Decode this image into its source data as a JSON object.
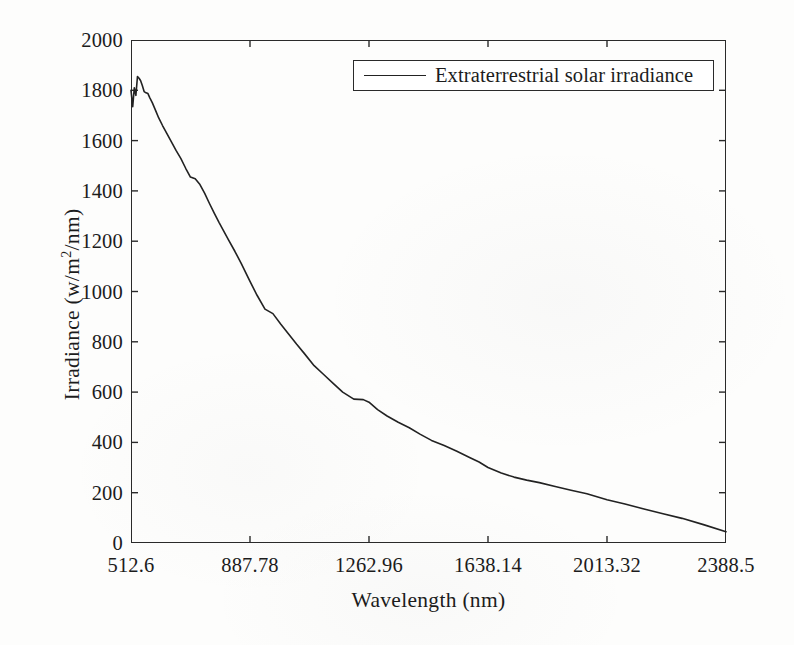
{
  "chart_data": {
    "type": "line",
    "title": "",
    "xlabel": "Wavelength (nm)",
    "ylabel": "Irradiance  (w/m2/nm)",
    "ylabel_base": "Irradiance  (w/m",
    "ylabel_sup": "2",
    "ylabel_tail": "/nm)",
    "xlim": [
      512.6,
      2388.5
    ],
    "ylim": [
      0,
      2000
    ],
    "grid": false,
    "legend_position": "top-right-inside",
    "xticks": [
      512.6,
      887.78,
      1262.96,
      1638.14,
      2013.32,
      2388.5
    ],
    "xtick_labels": [
      "512.6",
      "887.78",
      "1262.96",
      "1638.14",
      "2013.32",
      "2388.5"
    ],
    "yticks": [
      0,
      200,
      400,
      600,
      800,
      1000,
      1200,
      1400,
      1600,
      1800,
      2000
    ],
    "ytick_labels": [
      "0",
      "200",
      "400",
      "600",
      "800",
      "1000",
      "1200",
      "1400",
      "1600",
      "1800",
      "2000"
    ],
    "series": [
      {
        "name": "Extraterrestrial solar irradiance",
        "color": "#222222",
        "linewidth": 1.6,
        "x": [
          512.6,
          518,
          523,
          528,
          533,
          538,
          543,
          548,
          554,
          560,
          566,
          572,
          580,
          590,
          600,
          612,
          625,
          640,
          655,
          670,
          685,
          700,
          715,
          730,
          745,
          760,
          775,
          790,
          805,
          820,
          840,
          860,
          887.78,
          910,
          935,
          960,
          985,
          1010,
          1035,
          1060,
          1090,
          1120,
          1150,
          1180,
          1215,
          1245,
          1262.96,
          1290,
          1320,
          1355,
          1390,
          1425,
          1460,
          1500,
          1540,
          1580,
          1610,
          1638.14,
          1680,
          1720,
          1760,
          1800,
          1850,
          1900,
          1950,
          2013.32,
          2070,
          2130,
          2190,
          2250,
          2320,
          2388.5
        ],
        "y": [
          1800,
          1735,
          1810,
          1780,
          1855,
          1848,
          1838,
          1820,
          1795,
          1790,
          1787,
          1770,
          1750,
          1720,
          1690,
          1660,
          1630,
          1595,
          1560,
          1528,
          1490,
          1455,
          1448,
          1425,
          1390,
          1350,
          1312,
          1275,
          1240,
          1205,
          1160,
          1112,
          1040,
          985,
          930,
          912,
          870,
          830,
          790,
          752,
          705,
          670,
          635,
          600,
          572,
          570,
          560,
          530,
          505,
          480,
          458,
          432,
          408,
          388,
          365,
          340,
          322,
          300,
          278,
          262,
          250,
          240,
          225,
          210,
          196,
          172,
          155,
          135,
          116,
          98,
          72,
          45
        ]
      }
    ]
  },
  "legend": {
    "entries": [
      {
        "label": "Extraterrestrial solar irradiance"
      }
    ]
  }
}
